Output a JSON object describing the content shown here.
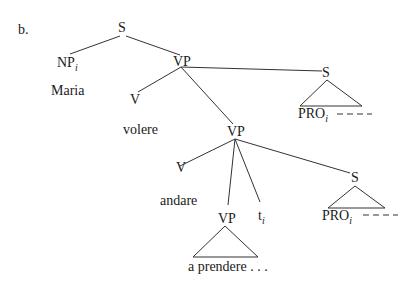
{
  "figure_label": "b.",
  "nodes": {
    "root_s": "S",
    "np": "NP",
    "np_index": "i",
    "maria": "Maria",
    "vp1": "VP",
    "v1": "V",
    "volere": "volere",
    "s_upper": "S",
    "pro_upper": "PRO",
    "pro_upper_index": "i",
    "vp2": "VP",
    "v2": "V",
    "andare": "andare",
    "vp3": "VP",
    "a_prendere": "a prendere . . .",
    "trace": "t",
    "trace_index": "i",
    "s_lower": "S",
    "pro_lower": "PRO",
    "pro_lower_index": "i"
  }
}
